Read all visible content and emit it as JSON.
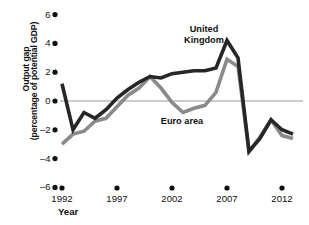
{
  "chart_data": {
    "type": "line",
    "title": "",
    "xlabel": "Year",
    "ylabel": "Output gap (percentage of potential GDP)",
    "ylabel_line1": "Output gap",
    "ylabel_line2": "(percentage of potential GDP)",
    "xlim": [
      1992,
      2013
    ],
    "ylim": [
      -6,
      6
    ],
    "yticks": [
      6,
      4,
      2,
      0,
      -2,
      -4,
      -6
    ],
    "ytick_labels": [
      "6",
      "4",
      "2",
      "0",
      "–2",
      "–4",
      "–6"
    ],
    "xticks": [
      1992,
      1997,
      2002,
      2007,
      2012
    ],
    "xtick_labels": [
      "1992",
      "1997",
      "2002",
      "2007",
      "2012"
    ],
    "grid": false,
    "zero_line": true,
    "legend_position": "inline-annotations",
    "series": [
      {
        "name": "United Kingdom",
        "color": "#262626",
        "x": [
          1992,
          1993,
          1994,
          1995,
          1996,
          1997,
          1998,
          1999,
          2000,
          2001,
          2002,
          2003,
          2004,
          2005,
          2006,
          2007,
          2008,
          2009,
          2010,
          2011,
          2012,
          2013
        ],
        "values": [
          1.2,
          -2.0,
          -0.8,
          -1.2,
          -0.6,
          0.2,
          0.8,
          1.3,
          1.7,
          1.6,
          1.9,
          2.0,
          2.1,
          2.1,
          2.3,
          4.2,
          3.0,
          -3.5,
          -2.6,
          -1.3,
          -2.0,
          -2.3
        ]
      },
      {
        "name": "Euro area",
        "color": "#8a8a8a",
        "x": [
          1992,
          1993,
          1994,
          1995,
          1996,
          1997,
          1998,
          1999,
          2000,
          2001,
          2002,
          2003,
          2004,
          2005,
          2006,
          2007,
          2008,
          2009,
          2010,
          2011,
          2012,
          2013
        ],
        "values": [
          -3.0,
          -2.3,
          -2.1,
          -1.4,
          -1.2,
          -0.4,
          0.4,
          0.9,
          1.7,
          0.9,
          -0.1,
          -0.8,
          -0.5,
          -0.3,
          0.6,
          2.9,
          2.4,
          -3.5,
          -2.5,
          -1.3,
          -2.4,
          -2.6
        ]
      }
    ],
    "annotations": [
      {
        "text_line1": "United",
        "text_line2": "Kingdom",
        "series": "United Kingdom"
      },
      {
        "text_line1": "Euro area",
        "text_line2": "",
        "series": "Euro area"
      }
    ]
  },
  "colors": {
    "uk": "#262626",
    "euro": "#8a8a8a",
    "axis": "#111111",
    "zero_line": "#9a9a9a",
    "background": "#ffffff"
  }
}
